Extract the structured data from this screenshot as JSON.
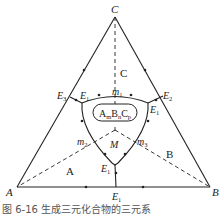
{
  "diagram": {
    "vertices": {
      "A": "A",
      "B": "B",
      "C": "C"
    },
    "regions": {
      "A": "A",
      "B": "B",
      "C": "C"
    },
    "compound": {
      "base1": "A",
      "sub1": "m",
      "base2": "B",
      "sub2": "n",
      "base3": "C",
      "sub3": "p"
    },
    "points": {
      "E1_bottom": "E",
      "E1_bottom_sub": "1",
      "E1_mid": "E",
      "E1_mid_sub": "1",
      "E1_left": "E",
      "E1_left_sub": "1",
      "E1_right": "E",
      "E1_right_sub": "1",
      "E2": "E",
      "E2_sub": "2",
      "E3": "E",
      "E3_sub": "3",
      "m1": "m",
      "m1_sub": "1",
      "m2": "m",
      "m2_sub": "2",
      "m3": "m",
      "m3_sub": "3",
      "M": "M"
    },
    "colors": {
      "line": "#222222",
      "background": "#ffffff"
    }
  },
  "caption": "图 6-16  生成三元化合物的三元系"
}
